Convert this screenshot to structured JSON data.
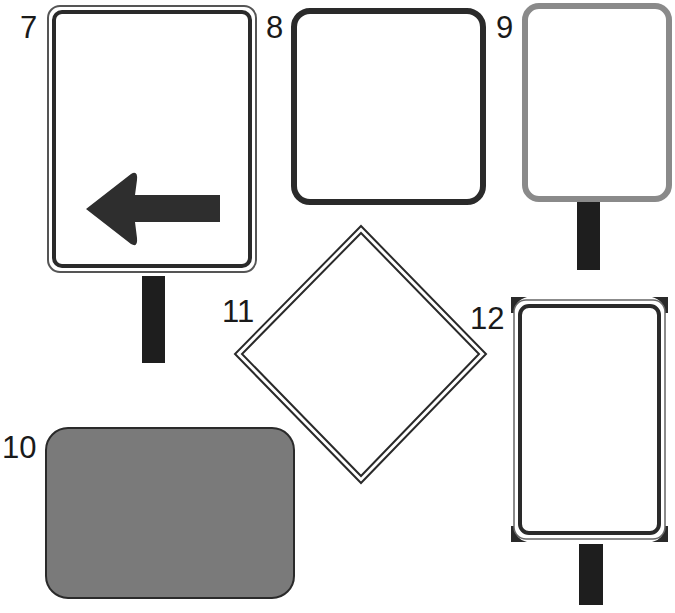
{
  "labels": {
    "sign7": "7",
    "sign8": "8",
    "sign9": "9",
    "sign10": "10",
    "sign11": "11",
    "sign12": "12"
  },
  "signs": [
    {
      "id": "7",
      "shape": "vertical rectangle, rounded, double border",
      "post": true,
      "symbol": "left-arrow-icon",
      "fill": "#ffffff"
    },
    {
      "id": "8",
      "shape": "square, rounded, thick dark border",
      "post": false,
      "fill": "#ffffff"
    },
    {
      "id": "9",
      "shape": "vertical rectangle, rounded, gray border",
      "post": true,
      "fill": "#ffffff"
    },
    {
      "id": "10",
      "shape": "horizontal rectangle, rounded, filled",
      "post": false,
      "fill": "#7a7a7a"
    },
    {
      "id": "11",
      "shape": "diamond, double border",
      "post": false,
      "fill": "#ffffff"
    },
    {
      "id": "12",
      "shape": "vertical rectangle, double border with corner tabs",
      "post": true,
      "fill": "#ffffff"
    }
  ],
  "colors": {
    "dark": "#2a2a2a",
    "gray_border": "#8a8a8a",
    "fill_gray": "#7a7a7a",
    "post": "#1e1e1e"
  }
}
